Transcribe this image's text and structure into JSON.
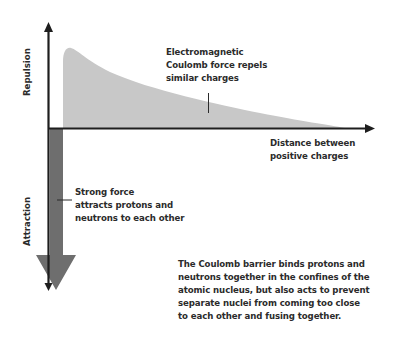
{
  "diagram": {
    "axes": {
      "y_positive_label": "Repulsion",
      "y_negative_label": "Attraction",
      "x_label_line1": "Distance between",
      "x_label_line2": "positive charges"
    },
    "annotations": {
      "electromagnetic": {
        "line1": "Electromagnetic",
        "line2": "Coulomb force repels",
        "line3": "similar charges"
      },
      "strong_force": {
        "line1": "Strong force",
        "line2": "attracts protons and",
        "line3": "neutrons to each other"
      }
    },
    "caption": {
      "line1": "The Coulomb barrier binds protons and",
      "line2": "neutrons together in the confines of the",
      "line3": "atomic nucleus, but also acts to prevent",
      "line4": "separate nuclei from coming too close",
      "line5": "to each other and fusing together."
    },
    "colors": {
      "repulsion_fill": "#c8c8c8",
      "attraction_fill": "#6e6e6e",
      "axis": "#1e1e1e",
      "text": "#2b2b2b"
    }
  }
}
